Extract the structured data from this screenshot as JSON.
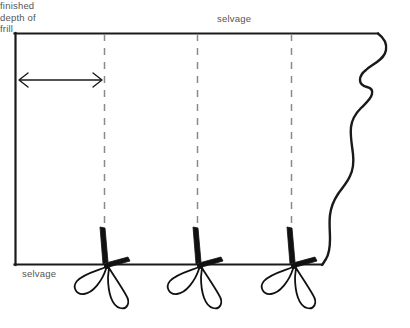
{
  "diagram": {
    "type": "sewing-pattern-diagram",
    "background_color": "#ffffff",
    "line_color": "#1a1a1a",
    "dash_color": "#888888",
    "text_color": "#555555",
    "labels": {
      "selvage_top": "selvage",
      "selvage_bottom": "selvage",
      "frill_depth_line1": "finished",
      "frill_depth_line2": "depth of",
      "frill_depth_line3": "frill",
      "frill_depth_full": "finished depth of frill"
    },
    "fabric": {
      "left_edge_x": 15,
      "top_edge_y": 33,
      "bottom_edge_y": 265,
      "top_edge_right_x": 378,
      "bottom_edge_right_x": 322,
      "right_edge_style": "wavy-torn-edge"
    },
    "cut_lines": [
      {
        "name": "cut-line-1",
        "x": 104,
        "style": "dashed"
      },
      {
        "name": "cut-line-2",
        "x": 197,
        "style": "dashed"
      },
      {
        "name": "cut-line-3",
        "x": 291,
        "style": "dashed"
      }
    ],
    "measure_arrow": {
      "name": "finished-depth-arrow",
      "from_x": 19,
      "to_x": 102,
      "y": 80,
      "heads": "both"
    },
    "scissors": [
      {
        "name": "scissors-1",
        "x": 104,
        "y": 265
      },
      {
        "name": "scissors-2",
        "x": 197,
        "y": 265
      },
      {
        "name": "scissors-3",
        "x": 291,
        "y": 265
      }
    ]
  }
}
